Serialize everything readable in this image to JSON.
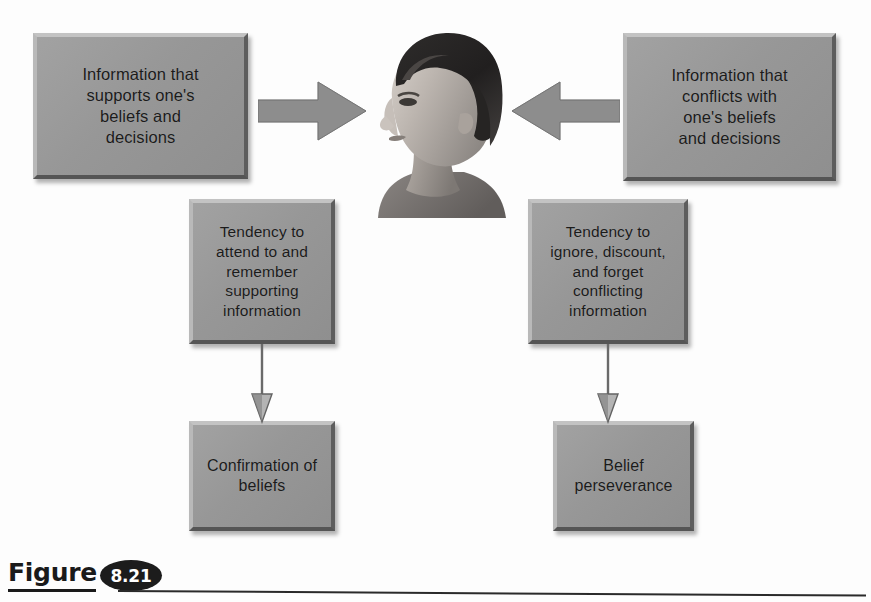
{
  "figure": {
    "caption_word": "Figure",
    "number": "8.21"
  },
  "diagram": {
    "type": "flow-diagram",
    "background_color": "#fdfdfd",
    "box_fill_color": "#9a9a9a",
    "text_color": "#1b1b1b",
    "arrow_color": "#8c8c8c",
    "boxes": [
      {
        "id": "support-info",
        "label": "Information that\nsupports one's\nbeliefs and\ndecisions",
        "position": "top-left"
      },
      {
        "id": "conflict-info",
        "label": "Information that\nconflicts with\none's beliefs\nand decisions",
        "position": "top-right"
      },
      {
        "id": "tendency-attend",
        "label": "Tendency to\nattend to and\nremember\nsupporting\ninformation",
        "position": "middle-left"
      },
      {
        "id": "tendency-ignore",
        "label": "Tendency to\nignore, discount,\nand forget\nconflicting\ninformation",
        "position": "middle-right"
      },
      {
        "id": "confirmation",
        "label": "Confirmation of\nbeliefs",
        "position": "bottom-left"
      },
      {
        "id": "perseverance",
        "label": "Belief\nperseverance",
        "position": "bottom-right"
      }
    ],
    "connectors": [
      {
        "id": "support-to-head",
        "from": "support-info",
        "to": "person-head",
        "direction": "right",
        "style": "block-arrow"
      },
      {
        "id": "conflict-to-head",
        "from": "conflict-info",
        "to": "person-head",
        "direction": "left",
        "style": "block-arrow"
      },
      {
        "id": "attend-to-confirmation",
        "from": "tendency-attend",
        "to": "confirmation",
        "direction": "down",
        "style": "thin-arrow"
      },
      {
        "id": "ignore-to-perseverance",
        "from": "tendency-ignore",
        "to": "perseverance",
        "direction": "down",
        "style": "thin-arrow"
      }
    ],
    "image": {
      "id": "person-head",
      "description": "Grayscale photograph of a person's head and shoulders in left profile"
    }
  }
}
